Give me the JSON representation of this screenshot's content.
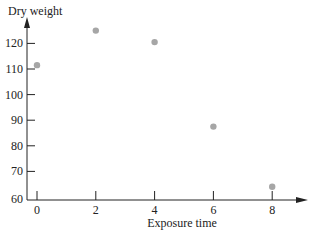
{
  "chart_data": {
    "type": "scatter",
    "title": "",
    "xlabel": "Exposure time",
    "ylabel": "Dry weight",
    "x": [
      0,
      2,
      4,
      6,
      8
    ],
    "y": [
      111.5,
      125,
      120.5,
      87.5,
      64
    ],
    "xticks": [
      "0",
      "2",
      "4",
      "6",
      "8"
    ],
    "yticks": [
      "60",
      "70",
      "80",
      "90",
      "100",
      "110",
      "120"
    ],
    "xlim": [
      0,
      9.5
    ],
    "ylim": [
      60,
      130
    ],
    "grid": false,
    "marker_color": "#a6a6a6",
    "axis_color": "#222222"
  }
}
